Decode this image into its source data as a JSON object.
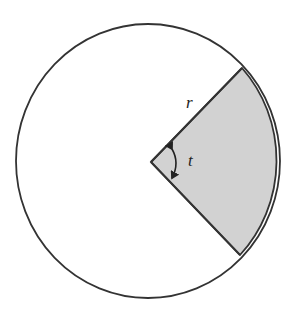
{
  "diagram": {
    "circle": {
      "cx": 148,
      "cy": 161,
      "rx": 132,
      "ry": 137,
      "stroke": "#333333",
      "fill": "#ffffff"
    },
    "sector": {
      "vertex": [
        151,
        162
      ],
      "end_top": [
        242,
        68
      ],
      "end_bottom": [
        240,
        255
      ],
      "fill": "#d2d2d2",
      "stroke": "#333333"
    },
    "labels": {
      "radius": "r",
      "angle": "t"
    },
    "angle_arrow": {
      "from": [
        174,
        146
      ],
      "to": [
        174,
        180
      ]
    }
  }
}
